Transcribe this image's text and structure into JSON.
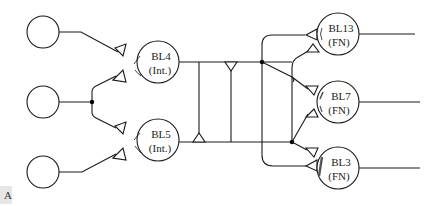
{
  "diagram": {
    "type": "neural circuit schematic",
    "input_cells": [
      {
        "id": "input-top",
        "label": ""
      },
      {
        "id": "input-middle",
        "label": ""
      },
      {
        "id": "input-bottom",
        "label": ""
      }
    ],
    "interneurons": [
      {
        "id": "BL4",
        "name": "BL4",
        "role": "(Int.)"
      },
      {
        "id": "BL5",
        "name": "BL5",
        "role": "(Int.)"
      }
    ],
    "output_cells": [
      {
        "id": "BL13",
        "name": "BL13",
        "role": "(FN)"
      },
      {
        "id": "BL7",
        "name": "BL7",
        "role": "(FN)"
      },
      {
        "id": "BL3",
        "name": "BL3",
        "role": "(FN)"
      }
    ],
    "panel_label": "A"
  },
  "colors": {
    "stroke": "#1a1a1a",
    "background": "#ffffff"
  }
}
